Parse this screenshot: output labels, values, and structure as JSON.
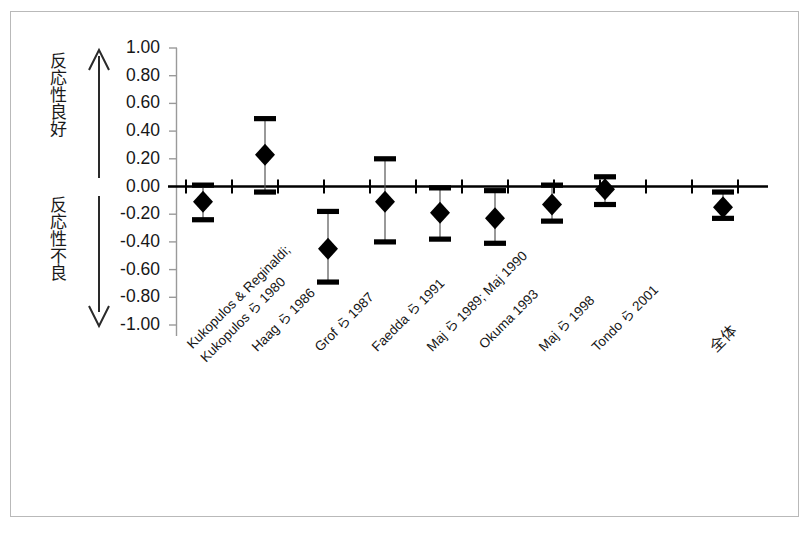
{
  "figure": {
    "background": "#ffffff",
    "border_color": "#b9b9b9",
    "ink_color": "#000000"
  },
  "axis_labels": {
    "upper": "反応性良好",
    "lower": "反応性不良",
    "upper_arrow": "up-arrow",
    "lower_arrow": "down-arrow"
  },
  "chart_data": {
    "type": "scatter",
    "title": "",
    "xlabel": "",
    "ylabel": "",
    "ylim": [
      -1.0,
      1.0
    ],
    "yticks": [
      "1.00",
      "0.80",
      "0.60",
      "0.40",
      "0.20",
      "0.00",
      "-0.20",
      "-0.40",
      "-0.60",
      "-0.80",
      "-1.00"
    ],
    "ytick_values": [
      1.0,
      0.8,
      0.6,
      0.4,
      0.2,
      0.0,
      -0.2,
      -0.4,
      -0.6,
      -0.8,
      -1.0
    ],
    "grid": false,
    "legend": "none",
    "zero_line": 0.0,
    "categories": [
      "Kukopulos & Reginaldi; Kukopulos ら 1980",
      "Haag ら 1986",
      "Grof ら 1987",
      "Faedda ら 1991",
      "Maj ら 1989; Maj 1990",
      "Okuma 1993",
      "Maj ら 1998",
      "Tondo ら 2001",
      "全体"
    ],
    "category_lines": [
      [
        "Kukopulos & Reginaldi;",
        "Kukopulos ら 1980"
      ],
      [
        "Haag ら 1986"
      ],
      [
        "Grof ら 1987"
      ],
      [
        "Faedda ら 1991"
      ],
      [
        "Maj ら 1989; Maj 1990"
      ],
      [
        "Okuma 1993"
      ],
      [
        "Maj ら 1998"
      ],
      [
        "Tondo ら 2001"
      ],
      [
        "全体"
      ]
    ],
    "series": [
      {
        "name": "effect-size",
        "marker": "diamond",
        "values": [
          -0.11,
          0.23,
          -0.45,
          -0.11,
          -0.19,
          -0.23,
          -0.13,
          -0.02,
          -0.15
        ],
        "ci_low": [
          -0.24,
          -0.04,
          -0.69,
          -0.4,
          -0.38,
          -0.41,
          -0.25,
          -0.13,
          -0.23
        ],
        "ci_high": [
          0.01,
          0.49,
          -0.18,
          0.2,
          -0.01,
          -0.03,
          0.01,
          0.07,
          -0.04
        ]
      }
    ],
    "points": [
      {
        "category": "Kukopulos & Reginaldi; Kukopulos ら 1980",
        "value": -0.11,
        "ci_low": -0.24,
        "ci_high": 0.01
      },
      {
        "category": "Haag ら 1986",
        "value": 0.23,
        "ci_low": -0.04,
        "ci_high": 0.49
      },
      {
        "category": "Grof ら 1987",
        "value": -0.45,
        "ci_low": -0.69,
        "ci_high": -0.18
      },
      {
        "category": "Faedda ら 1991",
        "value": -0.11,
        "ci_low": -0.4,
        "ci_high": 0.2
      },
      {
        "category": "Maj ら 1989; Maj 1990",
        "value": -0.19,
        "ci_low": -0.38,
        "ci_high": -0.01
      },
      {
        "category": "Okuma 1993",
        "value": -0.23,
        "ci_low": -0.41,
        "ci_high": -0.03
      },
      {
        "category": "Maj ら 1998",
        "value": -0.13,
        "ci_low": -0.25,
        "ci_high": 0.01
      },
      {
        "category": "Tondo ら 2001",
        "value": -0.02,
        "ci_low": -0.13,
        "ci_high": 0.07
      },
      {
        "category": "全体",
        "value": -0.15,
        "ci_low": -0.23,
        "ci_high": -0.04
      }
    ]
  }
}
